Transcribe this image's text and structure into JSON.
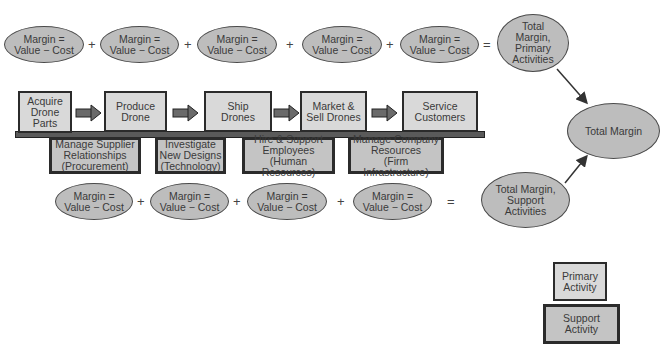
{
  "diagram": {
    "colors": {
      "ellipse_fill": "#bdbdbd",
      "primary_fill": "#d9d9d9",
      "support_fill": "#c4c4c4",
      "border": "#2b2b2b",
      "arrow": "#555555"
    },
    "top_margins": [
      {
        "label": "Margin =\nValue − Cost"
      },
      {
        "label": "Margin =\nValue − Cost"
      },
      {
        "label": "Margin =\nValue − Cost"
      },
      {
        "label": "Margin =\nValue − Cost"
      },
      {
        "label": "Margin =\nValue − Cost"
      }
    ],
    "bottom_margins": [
      {
        "label": "Margin =\nValue − Cost"
      },
      {
        "label": "Margin =\nValue − Cost"
      },
      {
        "label": "Margin =\nValue − Cost"
      },
      {
        "label": "Margin =\nValue − Cost"
      }
    ],
    "operators": {
      "plus": "+",
      "equals": "="
    },
    "primary_activities": [
      {
        "label": "Acquire\nDrone\nParts"
      },
      {
        "label": "Produce\nDrone"
      },
      {
        "label": "Ship\nDrones"
      },
      {
        "label": "Market &\nSell Drones"
      },
      {
        "label": "Service\nCustomers"
      }
    ],
    "support_activities": [
      {
        "label": "Manage Supplier\nRelationships\n(Procurement)"
      },
      {
        "label": "Investigate\nNew Designs\n(Technology)"
      },
      {
        "label": "Hire & Support\nEmployees\n(Human Resources)"
      },
      {
        "label": "Manage Company\nResources\n(Firm Infrastructure)"
      }
    ],
    "totals": {
      "primary": "Total\nMargin,\nPrimary\nActivities",
      "support": "Total Margin,\nSupport\nActivities",
      "total": "Total Margin"
    },
    "legend": {
      "primary": "Primary\nActivity",
      "support": "Support\nActivity"
    }
  }
}
